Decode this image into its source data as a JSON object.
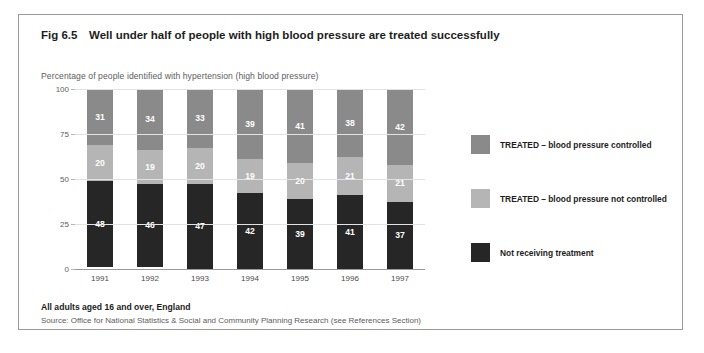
{
  "figure": {
    "number": "Fig 6.5",
    "title": "Well under half of people with high blood pressure are treated successfully",
    "axis_caption": "Percentage of people identified with hypertension (high blood pressure)",
    "footer_population": "All adults aged 16 and over, England",
    "footer_source": "Source: Office for National Statistics & Social and Community Planning Research (see References Section)"
  },
  "chart_data": {
    "type": "bar",
    "subtype": "stacked-column",
    "title": "Well under half of people with high blood pressure are treated successfully",
    "xlabel": "",
    "ylabel": "Percentage of people identified with hypertension (high blood pressure)",
    "ylim": [
      0,
      100
    ],
    "yticks": [
      0,
      25,
      50,
      75,
      100
    ],
    "ytick_labels": [
      "0",
      "25",
      "50",
      "75",
      "100"
    ],
    "grid": true,
    "legend_position": "right",
    "categories": [
      "1991",
      "1992",
      "1993",
      "1994",
      "1995",
      "1996",
      "1997"
    ],
    "series": [
      {
        "name": "Not receiving treatment",
        "color": "#262626",
        "values": [
          48,
          46,
          47,
          42,
          39,
          41,
          37
        ]
      },
      {
        "name": "TREATED – blood pressure not controlled",
        "color": "#b5b5b5",
        "values": [
          20,
          19,
          20,
          19,
          20,
          21,
          21
        ]
      },
      {
        "name": "TREATED – blood pressure controlled",
        "color": "#8a8a8a",
        "values": [
          31,
          34,
          33,
          39,
          41,
          38,
          42
        ]
      }
    ]
  },
  "legend": {
    "items": [
      {
        "label": "TREATED – blood pressure controlled",
        "color": "#8a8a8a"
      },
      {
        "label": "TREATED – blood pressure not controlled",
        "color": "#b5b5b5"
      },
      {
        "label": "Not receiving treatment",
        "color": "#262626"
      }
    ]
  }
}
